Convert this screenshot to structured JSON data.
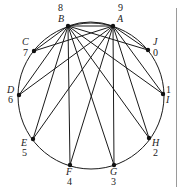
{
  "diagram": {
    "circle": {
      "cx": 91,
      "cy": 96,
      "r": 73
    },
    "nodes": [
      {
        "id": "A",
        "num": "9",
        "x": 113,
        "y": 26,
        "lx": 117,
        "ly": 22,
        "nx": 118,
        "ny": 11,
        "anchor": "start"
      },
      {
        "id": "B",
        "num": "8",
        "x": 68,
        "y": 26,
        "lx": 58,
        "ly": 22,
        "nx": 58,
        "ny": 11,
        "anchor": "start"
      },
      {
        "id": "C",
        "num": "7",
        "x": 34,
        "y": 51,
        "lx": 22,
        "ly": 45,
        "nx": 23,
        "ny": 56,
        "anchor": "start"
      },
      {
        "id": "D",
        "num": "6",
        "x": 19,
        "y": 95,
        "lx": 7,
        "ly": 93,
        "nx": 8,
        "ny": 103,
        "anchor": "start"
      },
      {
        "id": "E",
        "num": "5",
        "x": 33,
        "y": 139,
        "lx": 21,
        "ly": 146,
        "nx": 22,
        "ny": 156,
        "anchor": "start"
      },
      {
        "id": "F",
        "num": "4",
        "x": 70,
        "y": 165,
        "lx": 66,
        "ly": 175,
        "nx": 67,
        "ny": 185,
        "anchor": "start"
      },
      {
        "id": "G",
        "num": "3",
        "x": 114,
        "y": 165,
        "lx": 110,
        "ly": 175,
        "nx": 111,
        "ny": 185,
        "anchor": "start"
      },
      {
        "id": "H",
        "num": "2",
        "x": 149,
        "y": 138,
        "lx": 152,
        "ly": 146,
        "nx": 153,
        "ny": 156,
        "anchor": "start"
      },
      {
        "id": "I",
        "num": "1",
        "x": 163,
        "y": 94,
        "lx": 166,
        "ly": 103,
        "nx": 166,
        "ny": 93,
        "anchor": "start"
      },
      {
        "id": "J",
        "num": "0",
        "x": 148,
        "y": 50,
        "lx": 153,
        "ly": 45,
        "nx": 153,
        "ny": 56,
        "anchor": "start"
      }
    ],
    "edges": [
      [
        "B",
        "A"
      ],
      [
        "B",
        "C"
      ],
      [
        "B",
        "D"
      ],
      [
        "B",
        "E"
      ],
      [
        "B",
        "F"
      ],
      [
        "B",
        "G"
      ],
      [
        "B",
        "H"
      ],
      [
        "B",
        "I"
      ],
      [
        "B",
        "J"
      ],
      [
        "A",
        "C"
      ],
      [
        "A",
        "D"
      ],
      [
        "A",
        "E"
      ],
      [
        "A",
        "F"
      ],
      [
        "A",
        "G"
      ],
      [
        "A",
        "H"
      ],
      [
        "A",
        "I"
      ],
      [
        "A",
        "J"
      ]
    ],
    "line_color": "#1a1a1a",
    "node_color": "#111111"
  }
}
